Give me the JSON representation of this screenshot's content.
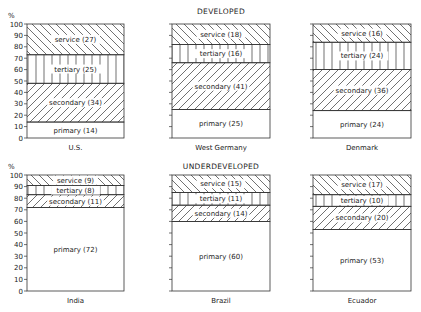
{
  "chart_data": [
    {
      "type": "bar",
      "stacked": true,
      "title": "DEVELOPED",
      "ylabel": "%",
      "ylim": [
        0,
        100
      ],
      "yticks": [
        0,
        10,
        20,
        30,
        40,
        50,
        60,
        70,
        80,
        90,
        100
      ],
      "categories": [
        "U.S.",
        "West Germany",
        "Denmark"
      ],
      "series": [
        {
          "name": "primary",
          "values": [
            14,
            25,
            24
          ]
        },
        {
          "name": "secondary",
          "values": [
            34,
            41,
            36
          ]
        },
        {
          "name": "tertiary",
          "values": [
            25,
            16,
            24
          ]
        },
        {
          "name": "service",
          "values": [
            27,
            18,
            16
          ]
        }
      ]
    },
    {
      "type": "bar",
      "stacked": true,
      "title": "UNDERDEVELOPED",
      "ylabel": "%",
      "ylim": [
        0,
        100
      ],
      "yticks": [
        0,
        10,
        20,
        30,
        40,
        50,
        60,
        70,
        80,
        90,
        100
      ],
      "categories": [
        "India",
        "Brazil",
        "Ecuador"
      ],
      "series": [
        {
          "name": "primary",
          "values": [
            72,
            60,
            53
          ]
        },
        {
          "name": "secondary",
          "values": [
            11,
            14,
            20
          ]
        },
        {
          "name": "tertiary",
          "values": [
            8,
            11,
            10
          ]
        },
        {
          "name": "service",
          "values": [
            9,
            15,
            17
          ]
        }
      ]
    }
  ],
  "labels": {
    "developed": "DEVELOPED",
    "underdeveloped": "UNDERDEVELOPED",
    "percent": "%"
  }
}
